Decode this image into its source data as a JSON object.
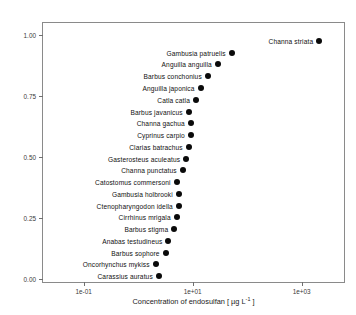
{
  "chart_data": {
    "type": "scatter",
    "title": "",
    "xlabel": "Concentration of endosulfan [ µg L",
    "xlabel_exponent": "-1",
    "xlabel_suffix": " ]",
    "ylabel": "Fraction of species affected",
    "x_scale": "log",
    "y_scale": "linear",
    "xlim": [
      0.018,
      6500
    ],
    "ylim": [
      -0.02,
      1.05
    ],
    "grid": false,
    "legend": null,
    "marker": "filled-circle",
    "marker_color": "#0a0a0a",
    "xticks": [
      {
        "label": "1e-01",
        "value": 0.1
      },
      {
        "label": "1e+01",
        "value": 10
      },
      {
        "label": "1e+03",
        "value": 1000
      }
    ],
    "yticks": [
      {
        "label": "0.00",
        "value": 0.0
      },
      {
        "label": "0.25",
        "value": 0.25
      },
      {
        "label": "0.50",
        "value": 0.5
      },
      {
        "label": "0.75",
        "value": 0.75
      },
      {
        "label": "1.00",
        "value": 1.0
      }
    ],
    "points": [
      {
        "label": "Carassius auratus",
        "x": 2.4,
        "y": 0.012
      },
      {
        "label": "Oncorhynchus mykiss",
        "x": 2.1,
        "y": 0.06
      },
      {
        "label": "Barbus sophore",
        "x": 3.2,
        "y": 0.108
      },
      {
        "label": "Anabas testudineus",
        "x": 3.6,
        "y": 0.156
      },
      {
        "label": "Barbus stigma",
        "x": 4.6,
        "y": 0.205
      },
      {
        "label": "Cirrhinus mrigala",
        "x": 5.1,
        "y": 0.253
      },
      {
        "label": "Ctenopharyngodon idella",
        "x": 5.6,
        "y": 0.301
      },
      {
        "label": "Gambusia holbrooki",
        "x": 5.6,
        "y": 0.349
      },
      {
        "label": "Catostomus commersoni",
        "x": 5.1,
        "y": 0.397
      },
      {
        "label": "Channa punctatus",
        "x": 6.6,
        "y": 0.446
      },
      {
        "label": "Gasterosteus aculeatus",
        "x": 7.6,
        "y": 0.494
      },
      {
        "label": "Clarias batrachus",
        "x": 8.5,
        "y": 0.542
      },
      {
        "label": "Cyprinus carpio",
        "x": 9.3,
        "y": 0.59
      },
      {
        "label": "Channa gachua",
        "x": 9.3,
        "y": 0.639
      },
      {
        "label": "Barbus javanicus",
        "x": 8.5,
        "y": 0.687
      },
      {
        "label": "Catla catla",
        "x": 11.5,
        "y": 0.735
      },
      {
        "label": "Anguilla japonica",
        "x": 14.0,
        "y": 0.783
      },
      {
        "label": "Barbus conchonius",
        "x": 19.0,
        "y": 0.831
      },
      {
        "label": "Anguilla anguilla",
        "x": 29.0,
        "y": 0.88
      },
      {
        "label": "Gambusia patruelis",
        "x": 52.0,
        "y": 0.928
      },
      {
        "label": "Channa striata",
        "x": 2100,
        "y": 0.976
      }
    ]
  }
}
